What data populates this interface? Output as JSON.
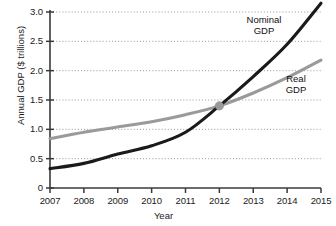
{
  "chart_data": {
    "type": "line",
    "title": "",
    "xlabel": "Year",
    "ylabel": "Annual GDP ($ trillions)",
    "xlim": [
      2007,
      2015
    ],
    "ylim": [
      0,
      3.0
    ],
    "grid": true,
    "grid_style": "dotted-horizontal",
    "legend_position": "inline-right",
    "x": [
      2007,
      2008,
      2009,
      2010,
      2011,
      2012,
      2013,
      2014,
      2015
    ],
    "xticklabels": [
      "2007",
      "2008",
      "2009",
      "2010",
      "2011",
      "2012",
      "2013",
      "2014",
      "2015"
    ],
    "yticks": [
      0,
      0.5,
      1.0,
      1.5,
      2.0,
      2.5,
      3.0
    ],
    "yticklabels": [
      "0",
      "0.5",
      "1.0",
      "1.5",
      "2.0",
      "2.5",
      "3.0"
    ],
    "series": [
      {
        "name": "Nominal GDP",
        "color": "#1a1a1a",
        "values": [
          0.33,
          0.42,
          0.58,
          0.72,
          0.95,
          1.4,
          1.9,
          2.45,
          3.15
        ]
      },
      {
        "name": "Real GDP",
        "color": "#9a9a9a",
        "values": [
          0.84,
          0.95,
          1.04,
          1.13,
          1.25,
          1.4,
          1.62,
          1.88,
          2.18
        ]
      }
    ],
    "annotations": [
      {
        "name": "crossover-marker",
        "x": 2012,
        "y": 1.4,
        "color": "#9a9a9a",
        "shape": "circle"
      }
    ]
  },
  "labels": {
    "nominal": "Nominal\nGDP",
    "real": "Real\nGDP",
    "x_axis_title": "Year",
    "y_axis_title": "Annual GDP ($ trillions)"
  },
  "colors": {
    "nominal": "#1a1a1a",
    "real": "#9a9a9a",
    "axis": "#3a3a3a",
    "grid": "#8c8c8c",
    "background": "#ffffff"
  }
}
